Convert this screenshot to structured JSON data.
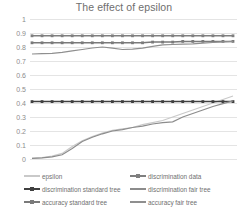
{
  "chart_data": {
    "type": "line",
    "title": "The effect of epsilon",
    "xlabel": "",
    "ylabel": "",
    "ylim": [
      0,
      1
    ],
    "yticks": [
      "0",
      "0.1",
      "0.2",
      "0.3",
      "0.4",
      "0.5",
      "0.6",
      "0.7",
      "0.8",
      "0.9",
      "1"
    ],
    "grid": true,
    "legend_position": "bottom",
    "x": [
      1,
      2,
      3,
      4,
      5,
      6,
      7,
      8,
      9,
      10,
      11,
      12,
      13,
      14,
      15,
      16,
      17,
      18,
      19,
      20,
      21
    ],
    "series": [
      {
        "name": "epsilon",
        "color": "#c9c9c9",
        "marker": "none",
        "values": [
          0.005,
          0.01,
          0.02,
          0.04,
          0.09,
          0.13,
          0.16,
          0.185,
          0.205,
          0.215,
          0.225,
          0.245,
          0.26,
          0.275,
          0.3,
          0.325,
          0.35,
          0.375,
          0.4,
          0.425,
          0.45
        ]
      },
      {
        "name": "discrimination data",
        "color": "#7f7f7f",
        "marker": "square",
        "values": [
          0.88,
          0.88,
          0.88,
          0.88,
          0.88,
          0.88,
          0.88,
          0.88,
          0.88,
          0.88,
          0.88,
          0.88,
          0.88,
          0.88,
          0.88,
          0.88,
          0.88,
          0.88,
          0.88,
          0.88,
          0.88
        ]
      },
      {
        "name": "discrimination standard tree",
        "color": "#404040",
        "marker": "square",
        "values": [
          0.41,
          0.41,
          0.41,
          0.41,
          0.41,
          0.41,
          0.41,
          0.41,
          0.41,
          0.41,
          0.41,
          0.41,
          0.41,
          0.41,
          0.41,
          0.41,
          0.41,
          0.41,
          0.41,
          0.41,
          0.41
        ]
      },
      {
        "name": "discrimination fair tree",
        "color": "#8c8c8c",
        "marker": "none",
        "values": [
          0.005,
          0.008,
          0.015,
          0.03,
          0.075,
          0.125,
          0.155,
          0.18,
          0.2,
          0.21,
          0.225,
          0.235,
          0.25,
          0.26,
          0.265,
          0.3,
          0.325,
          0.35,
          0.375,
          0.395,
          0.415
        ]
      },
      {
        "name": "accuracy standard tree",
        "color": "#7a7a7a",
        "marker": "square",
        "values": [
          0.83,
          0.83,
          0.83,
          0.83,
          0.83,
          0.83,
          0.83,
          0.83,
          0.83,
          0.83,
          0.83,
          0.83,
          0.835,
          0.835,
          0.835,
          0.84,
          0.84,
          0.84,
          0.84,
          0.84,
          0.84
        ]
      },
      {
        "name": "accuracy fair tree",
        "color": "#8f8f8f",
        "marker": "none",
        "values": [
          0.75,
          0.752,
          0.755,
          0.762,
          0.772,
          0.782,
          0.793,
          0.8,
          0.792,
          0.782,
          0.785,
          0.792,
          0.805,
          0.815,
          0.818,
          0.82,
          0.822,
          0.828,
          0.832,
          0.836,
          0.84
        ]
      }
    ]
  },
  "legend": {
    "items": [
      {
        "label": "epsilon",
        "color": "#c9c9c9",
        "marker": "none"
      },
      {
        "label": "discrimination data",
        "color": "#7f7f7f",
        "marker": "square"
      },
      {
        "label": "discrimination standard tree",
        "color": "#404040",
        "marker": "square"
      },
      {
        "label": "discrimination fair tree",
        "color": "#8c8c8c",
        "marker": "none"
      },
      {
        "label": "accuracy standard tree",
        "color": "#7a7a7a",
        "marker": "square"
      },
      {
        "label": "accuracy fair tree",
        "color": "#8f8f8f",
        "marker": "none"
      }
    ]
  }
}
